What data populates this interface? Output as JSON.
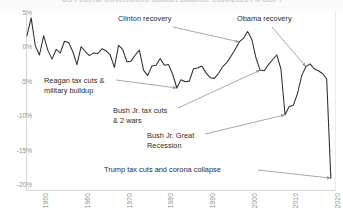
{
  "chart_data": {
    "type": "line",
    "title": "US Federal Government Budget Balance 1930-2020 (% GDP)",
    "xlabel": "",
    "ylabel": "",
    "ylim": [
      -20,
      5
    ],
    "xlim": [
      1947,
      2021
    ],
    "grid": false,
    "legend": null,
    "yticks": [
      "5%",
      "0%",
      "-5%",
      "-10%",
      "-15%",
      "-20%"
    ],
    "ytick_values": [
      5,
      0,
      -5,
      -10,
      -15,
      -20
    ],
    "xticks": [
      "1950",
      "1960",
      "1970",
      "1980",
      "1990",
      "2000",
      "2010",
      "2020"
    ],
    "xtick_values": [
      1950,
      1960,
      1970,
      1980,
      1990,
      2000,
      2010,
      2020
    ],
    "series": [
      {
        "name": "Federal budget balance (% GDP)",
        "color": "#2e2e2e",
        "x": [
          1947,
          1948,
          1949,
          1950,
          1951,
          1952,
          1953,
          1954,
          1955,
          1956,
          1957,
          1958,
          1959,
          1960,
          1961,
          1962,
          1963,
          1964,
          1965,
          1966,
          1967,
          1968,
          1969,
          1970,
          1971,
          1972,
          1973,
          1974,
          1975,
          1976,
          1977,
          1978,
          1979,
          1980,
          1981,
          1982,
          1983,
          1984,
          1985,
          1986,
          1987,
          1988,
          1989,
          1990,
          1991,
          1992,
          1993,
          1994,
          1995,
          1996,
          1997,
          1998,
          1999,
          2000,
          2001,
          2002,
          2003,
          2004,
          2005,
          2006,
          2007,
          2008,
          2009,
          2010,
          2011,
          2012,
          2013,
          2014,
          2015,
          2016,
          2017,
          2018,
          2019,
          2020
        ],
        "values": [
          1.7,
          4.3,
          0.2,
          -1.1,
          1.7,
          -0.4,
          -1.7,
          -0.3,
          -0.8,
          0.9,
          0.7,
          -0.6,
          -2.5,
          0.1,
          -0.6,
          -1.2,
          -0.8,
          -0.9,
          -0.2,
          -0.5,
          -1.1,
          -2.9,
          0.3,
          -0.3,
          -2.1,
          -2.0,
          -1.1,
          -0.4,
          -3.3,
          -4.1,
          -2.7,
          -2.6,
          -1.6,
          -2.6,
          -2.5,
          -3.9,
          -5.9,
          -4.7,
          -5.0,
          -4.9,
          -3.1,
          -3.0,
          -2.7,
          -3.7,
          -4.4,
          -4.5,
          -3.8,
          -2.8,
          -2.2,
          -1.3,
          -0.3,
          0.8,
          1.3,
          2.3,
          1.2,
          -1.5,
          -3.3,
          -3.4,
          -2.5,
          -1.8,
          -1.1,
          -3.1,
          -9.8,
          -8.6,
          -8.4,
          -6.7,
          -4.1,
          -2.8,
          -2.4,
          -3.1,
          -3.4,
          -3.8,
          -4.6,
          -19.0
        ],
        "units": "percent of GDP"
      }
    ],
    "annotations": [
      {
        "id": "clinton",
        "lines": [
          "Clinton recovery"
        ],
        "points_to_year": 1998,
        "points_to_value": 0.8
      },
      {
        "id": "obama",
        "lines": [
          "Obama recovery"
        ],
        "points_to_year": 2014,
        "points_to_value": -2.8
      },
      {
        "id": "reagan",
        "lines": [
          "Reagan tax cuts &",
          "military buildup"
        ],
        "points_to_year": 1983,
        "points_to_value": -5.9
      },
      {
        "id": "bush-jr",
        "lines": [
          "Bush Jr. tax cuts",
          "& 2 wars"
        ],
        "points_to_year": 2003,
        "points_to_value": -3.3
      },
      {
        "id": "great-recession",
        "lines": [
          "Bush Jr. Great",
          "Recession"
        ],
        "points_to_year": 2009,
        "points_to_value": -9.8
      },
      {
        "id": "trump",
        "lines": [
          "Trump tax cuts and corona collapse"
        ],
        "points_to_year": 2020,
        "points_to_value": -19.0
      }
    ]
  }
}
